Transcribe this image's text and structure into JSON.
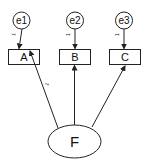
{
  "diagram": {
    "type": "path-diagram",
    "factor": {
      "id": "F",
      "label": "F"
    },
    "observed": [
      {
        "id": "A",
        "label": "A"
      },
      {
        "id": "B",
        "label": "B"
      },
      {
        "id": "C",
        "label": "C"
      }
    ],
    "errors": [
      {
        "id": "e1",
        "label": "e1",
        "target": "A",
        "path_label": "1"
      },
      {
        "id": "e2",
        "label": "e2",
        "target": "B",
        "path_label": "1"
      },
      {
        "id": "e3",
        "label": "e3",
        "target": "C",
        "path_label": "1"
      }
    ],
    "loadings": [
      {
        "from": "F",
        "to": "A",
        "label": "1"
      },
      {
        "from": "F",
        "to": "B",
        "label": ""
      },
      {
        "from": "F",
        "to": "C",
        "label": ""
      }
    ],
    "colors": {
      "stroke": "#222222",
      "background": "#ffffff"
    }
  }
}
